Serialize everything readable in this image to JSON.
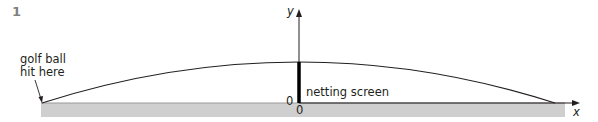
{
  "question_number": "1",
  "labels": {
    "start_line1": "golf ball",
    "start_line2": "hit here",
    "screen": "netting screen",
    "y_axis": "y",
    "x_axis": "x",
    "origin_left": "0",
    "origin_below": "0"
  },
  "colors": {
    "ground": "#cfcfcf",
    "ground_edge": "#9a9a9a",
    "line": "#231f20",
    "number": "#808080"
  },
  "geometry": {
    "ground": {
      "x": 41,
      "y": 103,
      "width": 524,
      "height": 14
    },
    "trajectory": {
      "start": [
        42,
        103
      ],
      "peak": [
        299,
        62
      ],
      "end": [
        555,
        103
      ]
    },
    "screen": {
      "x": 299,
      "top": 62,
      "bottom": 103
    },
    "y_axis": {
      "x": 299,
      "top": 10,
      "bottom": 103
    },
    "x_axis": {
      "y": 103,
      "left": 299,
      "right": 580
    }
  }
}
